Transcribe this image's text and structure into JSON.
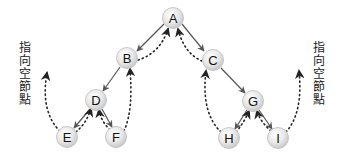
{
  "diagram": {
    "title": "",
    "type": "threaded-binary-tree",
    "labels": {
      "left_null": "指向空節點",
      "right_null": "指向空節點"
    },
    "nodes": [
      {
        "id": "A",
        "label": "A",
        "x": 173,
        "y": 18
      },
      {
        "id": "B",
        "label": "B",
        "x": 127,
        "y": 58
      },
      {
        "id": "C",
        "label": "C",
        "x": 213,
        "y": 60
      },
      {
        "id": "D",
        "label": "D",
        "x": 96,
        "y": 100
      },
      {
        "id": "E",
        "label": "E",
        "x": 67,
        "y": 137
      },
      {
        "id": "F",
        "label": "F",
        "x": 116,
        "y": 137
      },
      {
        "id": "G",
        "label": "G",
        "x": 253,
        "y": 101
      },
      {
        "id": "H",
        "label": "H",
        "x": 229,
        "y": 138
      },
      {
        "id": "I",
        "label": "I",
        "x": 278,
        "y": 138
      }
    ],
    "edges": [
      {
        "from": "A",
        "to": "B",
        "kind": "child"
      },
      {
        "from": "A",
        "to": "C",
        "kind": "child"
      },
      {
        "from": "B",
        "to": "D",
        "kind": "child"
      },
      {
        "from": "D",
        "to": "E",
        "kind": "child"
      },
      {
        "from": "D",
        "to": "F",
        "kind": "child"
      },
      {
        "from": "C",
        "to": "G",
        "kind": "child"
      },
      {
        "from": "G",
        "to": "H",
        "kind": "child"
      },
      {
        "from": "G",
        "to": "I",
        "kind": "child"
      }
    ],
    "threads": [
      {
        "from": "E",
        "to": "null-left",
        "kind": "thread"
      },
      {
        "from": "E",
        "to": "D",
        "kind": "thread"
      },
      {
        "from": "F",
        "to": "D",
        "kind": "thread"
      },
      {
        "from": "F",
        "to": "B",
        "kind": "thread"
      },
      {
        "from": "B",
        "to": "A",
        "kind": "thread"
      },
      {
        "from": "C",
        "to": "A",
        "kind": "thread"
      },
      {
        "from": "H",
        "to": "C",
        "kind": "thread"
      },
      {
        "from": "H",
        "to": "G",
        "kind": "thread"
      },
      {
        "from": "I",
        "to": "G",
        "kind": "thread"
      },
      {
        "from": "I",
        "to": "null-right",
        "kind": "thread"
      }
    ],
    "colors": {
      "node_fill": "#e6e6e6",
      "node_stroke": "#c8c8c8",
      "edge": "#555555",
      "thread": "#222222",
      "text": "#111111"
    }
  }
}
